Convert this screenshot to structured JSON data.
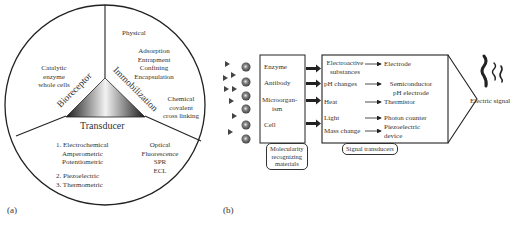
{
  "panel_a": {
    "label": "(a)",
    "center_triangle": {
      "fill_gradient": [
        "#1a1a1a",
        "#f2f2f2",
        "#1a1a1a"
      ]
    },
    "sectors": {
      "bioreceptor": {
        "title": "Bioreceptor",
        "items": [
          "Catalytic",
          "enzyme",
          "whole cells"
        ]
      },
      "immobilization": {
        "title": "Immobilization",
        "group1": [
          "Physical"
        ],
        "group2": [
          "Adsorption",
          "Entrapment",
          "Confining",
          "Encapsulation"
        ],
        "group3": [
          "Chemical",
          "covalent",
          "cross linking"
        ]
      },
      "transducer": {
        "title": "Transducer",
        "list": [
          "1. Electrochemical",
          "Amperometric",
          "Potentiometric",
          "2. Piezoelectric",
          "3. Thermometric"
        ],
        "optical": [
          "Optical",
          "Fluorescence",
          "SPR",
          "ECL"
        ]
      }
    }
  },
  "panel_b": {
    "label": "(b)",
    "recognizing_materials": [
      "Enzyme",
      "Antibody",
      "Microorgan-",
      "ism",
      "Cell"
    ],
    "recognizing_caption": [
      "Molecularity",
      "recognizing",
      "materials"
    ],
    "signals": [
      {
        "input": [
          "Electroactive",
          "substances"
        ],
        "output": [
          "Electrode"
        ]
      },
      {
        "input": [
          "pH changes"
        ],
        "output": [
          "Semiconductor",
          "pH electrode"
        ]
      },
      {
        "input": [
          "Heat"
        ],
        "output": [
          "Thermistor"
        ]
      },
      {
        "input": [
          "Light"
        ],
        "output": [
          "Photon counter"
        ]
      },
      {
        "input": [
          "Mass change"
        ],
        "output": [
          "Piezoelectric",
          "device"
        ]
      }
    ],
    "transducer_caption": "Signal transducers",
    "output_label": "Electric signal"
  }
}
